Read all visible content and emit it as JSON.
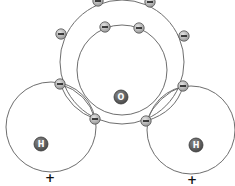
{
  "diagram": {
    "colors": {
      "orbit": "#6e6e6e",
      "electron": "#b8b8b8",
      "nucleus": "#6a6a6a",
      "background": "#ffffff"
    },
    "nuclei": [
      {
        "id": "oxygen",
        "symbol": "O",
        "x": 121,
        "y": 97,
        "r": 7
      },
      {
        "id": "hydrogen-left",
        "symbol": "H",
        "x": 41,
        "y": 144,
        "r": 7
      },
      {
        "id": "hydrogen-right",
        "symbol": "H",
        "x": 196,
        "y": 145,
        "r": 7
      }
    ],
    "orbits": [
      {
        "id": "oxygen-inner",
        "cx": 122,
        "cy": 70,
        "r": 45
      },
      {
        "id": "oxygen-outer",
        "cx": 122,
        "cy": 62,
        "r": 62
      },
      {
        "id": "hydrogen-left-shell",
        "cx": 51,
        "cy": 127,
        "r": 45
      },
      {
        "id": "hydrogen-right-shell",
        "cx": 191,
        "cy": 130,
        "r": 44
      }
    ],
    "electron_symbol": "−",
    "electrons": [
      {
        "id": "inner-1",
        "x": 105,
        "y": 27
      },
      {
        "id": "inner-2",
        "x": 139,
        "y": 28
      },
      {
        "id": "outer-top-left",
        "x": 98,
        "y": 1
      },
      {
        "id": "outer-top-right",
        "x": 150,
        "y": 2
      },
      {
        "id": "outer-left",
        "x": 61,
        "y": 34
      },
      {
        "id": "outer-right",
        "x": 184,
        "y": 36
      },
      {
        "id": "bond-left-upper",
        "x": 60,
        "y": 84
      },
      {
        "id": "bond-left-lower",
        "x": 95,
        "y": 119
      },
      {
        "id": "bond-right-upper",
        "x": 183,
        "y": 86
      },
      {
        "id": "bond-right-lower",
        "x": 146,
        "y": 121
      }
    ],
    "charges": [
      {
        "id": "charge-left",
        "symbol": "+",
        "x": 50,
        "y": 178
      },
      {
        "id": "charge-right",
        "symbol": "+",
        "x": 192,
        "y": 180
      }
    ]
  }
}
